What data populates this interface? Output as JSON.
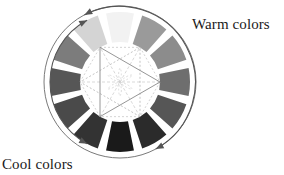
{
  "figure": {
    "background_color": "#ffffff",
    "center": {
      "x": 120,
      "y": 82
    },
    "outer_circle_radius": 76,
    "outer_circle_stroke": "#7a7a7a",
    "ring_outer_radius": 70,
    "ring_inner_radius": 40,
    "segment_gap_degrees": 7
  },
  "labels": {
    "warm": "Warm colors",
    "cool": "Cool colors",
    "text_color": "#1a1a1a"
  },
  "wheel": {
    "segment_count": 12,
    "segments": [
      {
        "index": 0,
        "name": "segment-yellow",
        "start_deg": -105,
        "end_deg": -75,
        "color": "#f2f2f2",
        "group": "warm"
      },
      {
        "index": 1,
        "name": "segment-yellow-orange",
        "start_deg": -75,
        "end_deg": -45,
        "color": "#9a9a9a",
        "group": "warm"
      },
      {
        "index": 2,
        "name": "segment-orange",
        "start_deg": -45,
        "end_deg": -15,
        "color": "#8c8c8c",
        "group": "warm"
      },
      {
        "index": 3,
        "name": "segment-red-orange",
        "start_deg": -15,
        "end_deg": 15,
        "color": "#6e6e6e",
        "group": "warm"
      },
      {
        "index": 4,
        "name": "segment-red",
        "start_deg": 15,
        "end_deg": 45,
        "color": "#565656",
        "group": "warm"
      },
      {
        "index": 5,
        "name": "segment-red-violet",
        "start_deg": 45,
        "end_deg": 75,
        "color": "#2b2b2b",
        "group": "cool"
      },
      {
        "index": 6,
        "name": "segment-violet",
        "start_deg": 75,
        "end_deg": 105,
        "color": "#1a1a1a",
        "group": "cool"
      },
      {
        "index": 7,
        "name": "segment-blue-violet",
        "start_deg": 105,
        "end_deg": 135,
        "color": "#333333",
        "group": "cool"
      },
      {
        "index": 8,
        "name": "segment-blue",
        "start_deg": 135,
        "end_deg": 165,
        "color": "#4a4a4a",
        "group": "cool"
      },
      {
        "index": 9,
        "name": "segment-blue-green",
        "start_deg": 165,
        "end_deg": 195,
        "color": "#565656",
        "group": "cool"
      },
      {
        "index": 10,
        "name": "segment-green",
        "start_deg": 195,
        "end_deg": 225,
        "color": "#7c7c7c",
        "group": "cool"
      },
      {
        "index": 11,
        "name": "segment-yellow-green",
        "start_deg": 225,
        "end_deg": 255,
        "color": "#d4d4d4",
        "group": "warm"
      }
    ]
  },
  "arrows": {
    "warm_arc": {
      "name": "warm-colors-arc",
      "radius": 76,
      "start_deg": -118,
      "end_deg": 62,
      "stroke": "#555555",
      "arrowheads": [
        "start",
        "end"
      ]
    },
    "cool_arc": {
      "name": "cool-colors-arc",
      "radius": 70,
      "start_deg": 118,
      "end_deg": 242,
      "stroke": "#555555",
      "arrowheads": [
        "start",
        "end"
      ]
    }
  },
  "inner_geometry": {
    "hexagon_radius": 40,
    "hexagon_rotation_deg": 0,
    "primary_triangle": {
      "name": "primary-triangle",
      "vertices_deg": [
        0,
        120,
        240
      ],
      "stroke": "#8a8a8a",
      "dash": "none"
    },
    "secondary_triangle": {
      "name": "secondary-triangle",
      "vertices_deg": [
        60,
        180,
        300
      ],
      "stroke": "#b5b5b5",
      "dash": "2,2"
    },
    "hexagon_outline": {
      "name": "hexagon-outline",
      "stroke": "#c2c2c2",
      "dash": "2,2"
    },
    "diagonals": {
      "name": "center-diagonals",
      "stroke": "#c8c8c8",
      "dash": "3,2"
    },
    "inner_star": {
      "name": "inner-star",
      "radius": 14,
      "stroke": "#cfcfcf",
      "dash": "2,2"
    }
  }
}
